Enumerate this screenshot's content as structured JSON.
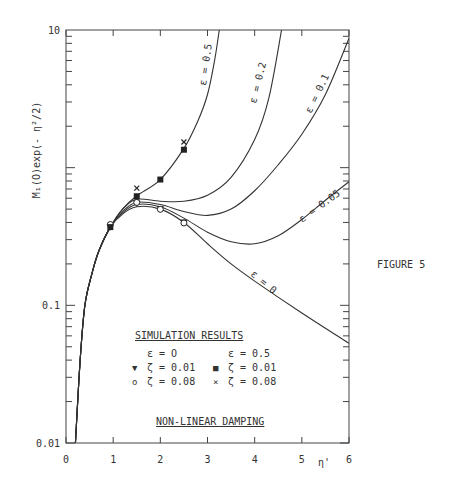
{
  "figure_label": "FIGURE 5",
  "chart_data": {
    "type": "line",
    "title": "",
    "xlabel": "η'",
    "ylabel": "M_1(O)exp(-η²/2)",
    "xlim": [
      0,
      6
    ],
    "ylim": [
      0.01,
      10
    ],
    "yscale": "log",
    "x_ticks": [
      "0",
      "1",
      "2",
      "3",
      "4",
      "5",
      "6"
    ],
    "y_tick_labels": [
      {
        "value": 10,
        "label": "10"
      },
      {
        "value": 0.1,
        "label": "0.1"
      },
      {
        "value": 0.01,
        "label": "0.01"
      }
    ],
    "grid": false,
    "common_rise": [
      [
        0.2,
        0.01
      ],
      [
        0.3,
        0.04
      ],
      [
        0.4,
        0.1
      ],
      [
        0.55,
        0.17
      ],
      [
        0.7,
        0.25
      ],
      [
        0.94,
        0.37
      ]
    ],
    "series": [
      {
        "name": "ε = 0",
        "label": "ε = 0",
        "points": [
          [
            0.94,
            0.37
          ],
          [
            1.2,
            0.46
          ],
          [
            1.5,
            0.52
          ],
          [
            2,
            0.5
          ],
          [
            2.5,
            0.4
          ],
          [
            3,
            0.28
          ],
          [
            3.5,
            0.2
          ],
          [
            4,
            0.15
          ],
          [
            5,
            0.088
          ],
          [
            6,
            0.053
          ]
        ]
      },
      {
        "name": "ε = 0.05",
        "label": "ε = 0.05",
        "points": [
          [
            0.94,
            0.37
          ],
          [
            1.2,
            0.47
          ],
          [
            1.5,
            0.54
          ],
          [
            2,
            0.52
          ],
          [
            2.5,
            0.43
          ],
          [
            3,
            0.34
          ],
          [
            3.5,
            0.29
          ],
          [
            4,
            0.28
          ],
          [
            4.5,
            0.32
          ],
          [
            5,
            0.42
          ],
          [
            5.5,
            0.58
          ],
          [
            6,
            0.79
          ]
        ]
      },
      {
        "name": "ε = 0.1",
        "label": "ε = 0.1",
        "points": [
          [
            0.94,
            0.37
          ],
          [
            1.2,
            0.48
          ],
          [
            1.5,
            0.56
          ],
          [
            2,
            0.54
          ],
          [
            2.5,
            0.48
          ],
          [
            3,
            0.45
          ],
          [
            3.5,
            0.5
          ],
          [
            4,
            0.68
          ],
          [
            4.5,
            1.05
          ],
          [
            5,
            1.75
          ],
          [
            5.5,
            3.4
          ],
          [
            6,
            8.7
          ]
        ]
      },
      {
        "name": "ε = 0.2",
        "label": "ε = 0.2",
        "points": [
          [
            0.94,
            0.37
          ],
          [
            1.2,
            0.5
          ],
          [
            1.5,
            0.59
          ],
          [
            2,
            0.57
          ],
          [
            2.5,
            0.57
          ],
          [
            3,
            0.63
          ],
          [
            3.5,
            0.85
          ],
          [
            4,
            1.6
          ],
          [
            4.3,
            3.2
          ],
          [
            4.57,
            10
          ]
        ]
      },
      {
        "name": "ε = 0.5",
        "label": "ε = 0.5",
        "points": [
          [
            0.94,
            0.37
          ],
          [
            1.2,
            0.5
          ],
          [
            1.5,
            0.625
          ],
          [
            2,
            0.82
          ],
          [
            2.5,
            1.38
          ],
          [
            2.8,
            2.2
          ],
          [
            3,
            3.4
          ],
          [
            3.15,
            6
          ],
          [
            3.25,
            10
          ]
        ]
      }
    ],
    "markers": [
      {
        "symbol": "triangle-down",
        "eps": 0,
        "zeta": 0.01,
        "points": [
          [
            0.94,
            0.37
          ],
          [
            1.5,
            0.55
          ],
          [
            2,
            0.5
          ],
          [
            2.5,
            0.4
          ]
        ]
      },
      {
        "symbol": "circle",
        "eps": 0,
        "zeta": 0.08,
        "points": [
          [
            0.94,
            0.38
          ],
          [
            1.5,
            0.55
          ],
          [
            2,
            0.49
          ],
          [
            2.5,
            0.39
          ]
        ]
      },
      {
        "symbol": "square",
        "eps": 0.5,
        "zeta": 0.01,
        "points": [
          [
            0.94,
            0.37
          ],
          [
            1.5,
            0.62
          ],
          [
            2,
            0.82
          ],
          [
            2.5,
            1.35
          ]
        ]
      },
      {
        "symbol": "x",
        "eps": 0.5,
        "zeta": 0.08,
        "points": [
          [
            1.5,
            0.67
          ],
          [
            2.5,
            1.45
          ]
        ]
      }
    ],
    "legend": {
      "title": "SIMULATION RESULTS",
      "col1_header": "ε = O",
      "col2_header": "ε = 0.5",
      "rows": [
        {
          "sym1": "▼",
          "text1": "ζ = 0.01",
          "sym2": "■",
          "text2": "ζ = 0.01"
        },
        {
          "sym1": "o",
          "text1": "ζ = 0.08",
          "sym2": "×",
          "text2": "ζ = 0.08"
        }
      ]
    },
    "annotation": "NON-LINEAR DAMPING"
  }
}
